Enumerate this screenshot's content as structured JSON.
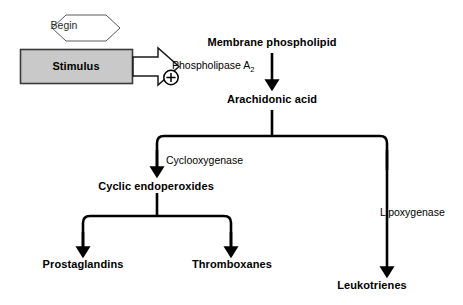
{
  "diagram": {
    "background_color": "#ffffff",
    "line_color": "#000000",
    "box_fill_color": "#c9c9c9",
    "box_border_color": "#3a3a3a",
    "nodes": {
      "begin": {
        "label": "Begin",
        "shape": "hexagon"
      },
      "stimulus": {
        "label": "Stimulus",
        "shape": "rectangle"
      },
      "membrane_phospholipid": {
        "label": "Membrane phospholipid"
      },
      "arachidonic_acid": {
        "label": "Arachidonic acid"
      },
      "cyclic_endoperoxides": {
        "label": "Cyclic endoperoxides"
      },
      "prostaglandins": {
        "label": "Prostaglandins"
      },
      "thromboxanes": {
        "label": "Thromboxanes"
      },
      "leukotrienes": {
        "label": "Leukotrienes"
      }
    },
    "enzymes": {
      "phospholipase_name": "Phospholipase A",
      "phospholipase_subscript": "2",
      "cyclooxygenase": "Cyclooxygenase",
      "lipoxygenase": "Lipoxygenase"
    },
    "symbols": {
      "plus_sign": "+"
    }
  }
}
